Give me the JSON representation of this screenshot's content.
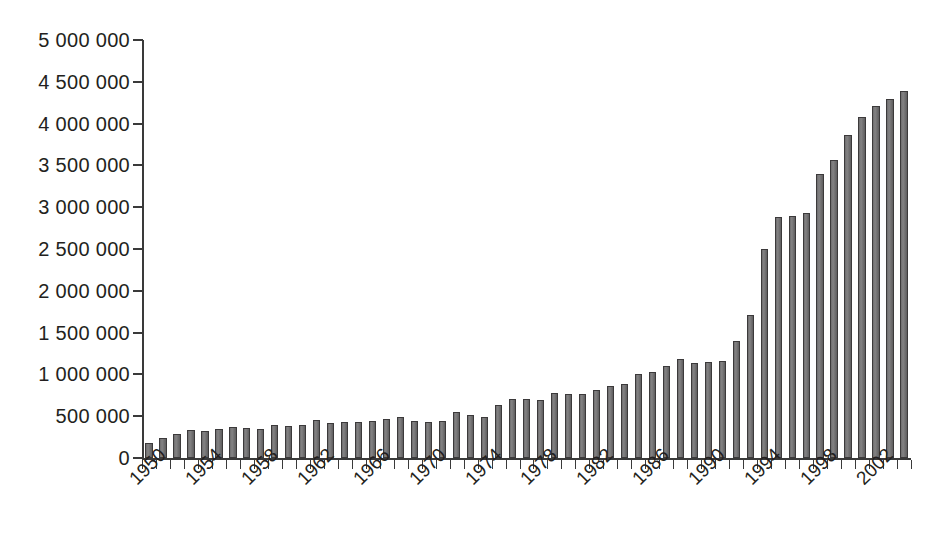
{
  "chart_data": {
    "type": "bar",
    "title": "",
    "subtitle": "",
    "xlabel": "",
    "ylabel": "",
    "ylim": [
      0,
      5000000
    ],
    "ytick_step": 500000,
    "grid": false,
    "legend": null,
    "bar_color": "#777677",
    "bar_edge_color": "#3c3a3b",
    "axis_color": "#3a3a3a",
    "text_color": "#231f20",
    "ytick_labels": [
      "5 000 000",
      "4 500 000",
      "4 000 000",
      "3 500 000",
      "3 000 000",
      "2 500 000",
      "2 000 000",
      "1 500 000",
      "1 000 000",
      "500 000",
      "0"
    ],
    "ytick_values": [
      5000000,
      4500000,
      4000000,
      3500000,
      3000000,
      2500000,
      2000000,
      1500000,
      1000000,
      500000,
      0
    ],
    "xtick_labels": [
      "1950",
      "1954",
      "1958",
      "1962",
      "1966",
      "1970",
      "1974",
      "1978",
      "1982",
      "1986",
      "1990",
      "1994",
      "1998",
      "2002"
    ],
    "xtick_label_rotation": -45,
    "xtick_label_interval": 4,
    "categories": [
      "1950",
      "1951",
      "1952",
      "1953",
      "1954",
      "1955",
      "1956",
      "1957",
      "1958",
      "1959",
      "1960",
      "1961",
      "1962",
      "1963",
      "1964",
      "1965",
      "1966",
      "1967",
      "1968",
      "1969",
      "1970",
      "1971",
      "1972",
      "1973",
      "1974",
      "1975",
      "1976",
      "1977",
      "1978",
      "1979",
      "1980",
      "1981",
      "1982",
      "1983",
      "1984",
      "1985",
      "1986",
      "1987",
      "1988",
      "1989",
      "1990",
      "1991",
      "1992",
      "1993",
      "1994",
      "1995",
      "1996",
      "1997",
      "1998",
      "1999",
      "2000",
      "2001",
      "2002",
      "2003",
      "2004"
    ],
    "values": [
      175000,
      245000,
      290000,
      330000,
      325000,
      345000,
      375000,
      355000,
      350000,
      390000,
      385000,
      400000,
      460000,
      420000,
      425000,
      430000,
      440000,
      465000,
      495000,
      440000,
      430000,
      445000,
      550000,
      510000,
      490000,
      630000,
      700000,
      705000,
      690000,
      775000,
      760000,
      770000,
      810000,
      860000,
      880000,
      1000000,
      1030000,
      1100000,
      1190000,
      1135000,
      1150000,
      1155000,
      1400000,
      1715000,
      2500000,
      2880000,
      2890000,
      2930000,
      3400000,
      3560000,
      3860000,
      4080000,
      4210000,
      4300000,
      4390000
    ]
  }
}
